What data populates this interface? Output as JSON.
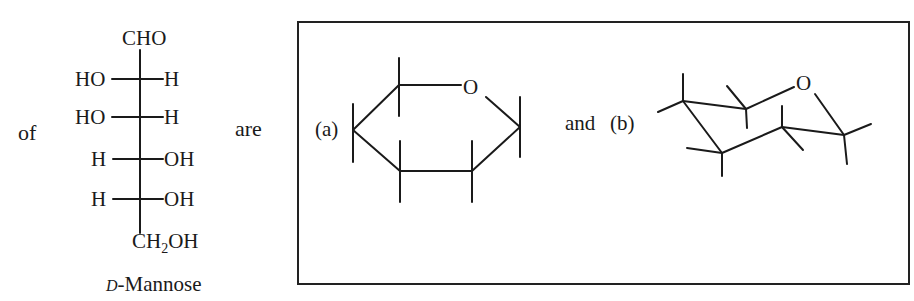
{
  "sentence": {
    "word_of": "of",
    "word_are": "are",
    "label_a": "(a)",
    "word_and": "and",
    "label_b": "(b)"
  },
  "fischer_projection": {
    "top_group": "CHO",
    "rows": [
      {
        "left": "HO",
        "right": "H"
      },
      {
        "left": "HO",
        "right": "H"
      },
      {
        "left": "H",
        "right": "OH"
      },
      {
        "left": "H",
        "right": "OH"
      }
    ],
    "bottom_group_main": "CH",
    "bottom_group_sub": "2",
    "bottom_group_tail": "OH",
    "caption_prefix": "D",
    "caption_name": "-Mannose"
  },
  "answer_box": {
    "ring_a": {
      "heteroatom": "O",
      "type": "hexagon-pyranose"
    },
    "ring_b": {
      "heteroatom": "O",
      "type": "chair-pyranose"
    }
  }
}
